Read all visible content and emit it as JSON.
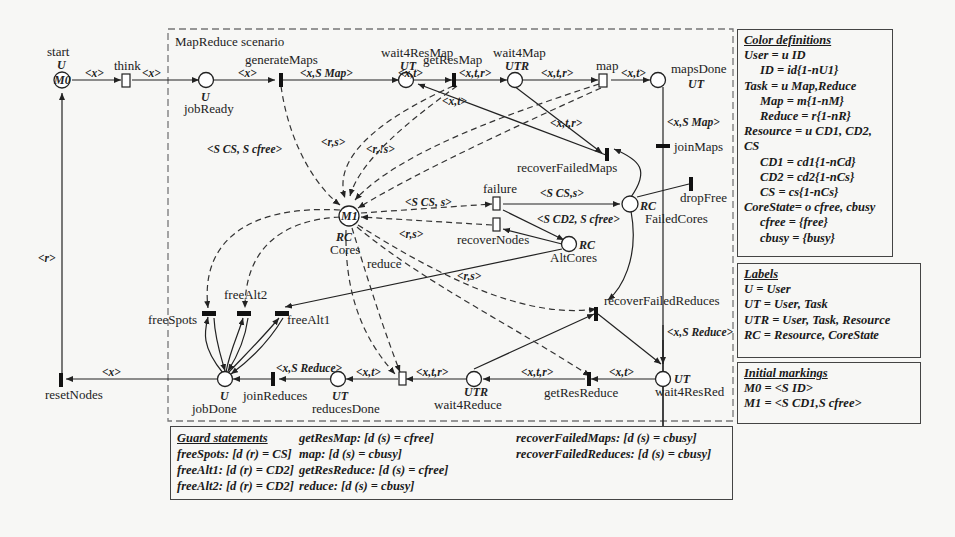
{
  "scenario": {
    "title": "MapReduce scenario"
  },
  "places": {
    "start": {
      "name": "start",
      "color": "U",
      "marking": "M0"
    },
    "jobReady": {
      "name": "jobReady",
      "color": "U"
    },
    "wait4ResMap": {
      "name": "wait4ResMap",
      "color": "UT"
    },
    "wait4Map": {
      "name": "wait4Map",
      "color": "UTR"
    },
    "mapsDone": {
      "name": "mapsDone",
      "color": "UT"
    },
    "cores": {
      "name": "Cores",
      "color": "RC",
      "marking": "M1"
    },
    "failedCores": {
      "name": "FailedCores",
      "color": "RC"
    },
    "altCores": {
      "name": "AltCores",
      "color": "RC"
    },
    "jobDone": {
      "name": "jobDone",
      "color": "U"
    },
    "reducesDone": {
      "name": "reducesDone",
      "color": "UT"
    },
    "wait4Reduce": {
      "name": "wait4Reduce",
      "color": "UTR"
    },
    "wait4ResRed": {
      "name": "wait4ResRed",
      "color": "UT"
    }
  },
  "transitions": {
    "think": "think",
    "generateMaps": "generateMaps",
    "getResMap": "getResMap",
    "map": "map",
    "joinMaps": "joinMaps",
    "recoverFailedMaps": "recoverFailedMaps",
    "dropFree": "dropFree",
    "failure": "failure",
    "recoverNodes": "recoverNodes",
    "reduce": "reduce",
    "freeSpots": "freeSpots",
    "freeAlt1": "freeAlt1",
    "freeAlt2": "freeAlt2",
    "recoverFailedReduces": "recoverFailedReduces",
    "joinReduces": "joinReduces",
    "getResReduce": "getResReduce",
    "resetNodes": "resetNodes"
  },
  "arc_labels": {
    "start_think": "<x>",
    "think_jobReady": "<x>",
    "jobReady_generateMaps": "<x>",
    "generateMaps_wait4ResMap": "<x,S Map>",
    "wait4ResMap_getResMap": "<x,t>",
    "getResMap_wait4Map": "<x,t,r>",
    "wait4Map_map": "<x,t,r>",
    "map_mapsDone": "<x,t>",
    "recover_wait4ResMap": "<x,t>",
    "wait4Map_recover": "<x,t,r>",
    "mapsDone_joinMaps": "<x,S Map>",
    "cores_generate": "<S CS, S cfree>",
    "rs1": "<r,s>",
    "rnots": "<r,!s>",
    "failure_cores": "<S CS, s>",
    "recover_cores": "<r,s>",
    "reduce_rs": "<r,s>",
    "failure_failed": "<S CS,s>",
    "failure_alt": "<S CD2, S cfree>",
    "reset_start": "<r>",
    "jobDone_reset": "<x>",
    "joinReduces_reducesDone": "<x,S Reduce>",
    "reducesDone_reduce": "<x,t>",
    "reduce_wait4Reduce": "<x,t,r>",
    "wait4Reduce_getResReduce": "<x,t,r>",
    "getResReduce_wait4ResRed": "<x,t>",
    "rfr_wait4ResRed": "<x,S Reduce>"
  },
  "color_definitions": {
    "title": "Color definitions",
    "lines": [
      {
        "text": "User = u ID",
        "indent": false
      },
      {
        "text": "ID = id{1-nU1}",
        "indent": true
      },
      {
        "text": "Task = u Map,Reduce",
        "indent": false
      },
      {
        "text": "Map = m{1-nM}",
        "indent": true
      },
      {
        "text": "Reduce = r{1-nR}",
        "indent": true
      },
      {
        "text": "Resource = u CD1, CD2, CS",
        "indent": false
      },
      {
        "text": "CD1 = cd1{1-nCd}",
        "indent": true
      },
      {
        "text": "CD2 = cd2{1-nCs}",
        "indent": true
      },
      {
        "text": "CS = cs{1-nCs}",
        "indent": true
      },
      {
        "text": "CoreState= o cfree, cbusy",
        "indent": false
      },
      {
        "text": "cfree = {free}",
        "indent": true
      },
      {
        "text": "cbusy = {busy}",
        "indent": true
      }
    ]
  },
  "labels": {
    "title": "Labels",
    "lines": [
      "U = User",
      "UT = User, Task",
      "UTR = User, Task, Resource",
      "RC = Resource, CoreState"
    ]
  },
  "initial_markings": {
    "title": "Initial markings",
    "lines": [
      "M0 = <S ID>",
      "M1 = <S CD1,S cfree>"
    ]
  },
  "guard_statements": {
    "title": "Guard statements",
    "col1": [
      "freeSpots: [d (r) = CS]",
      "freeAlt1: [d (r) = CD2]",
      "freeAlt2: [d (r) = CD2]"
    ],
    "col2": [
      "getResMap: [d (s) = cfree]",
      "map: [d (s) = cbusy]",
      "getResReduce: [d (s) = cfree]",
      "reduce: [d (s) = cbusy]"
    ],
    "col3": [
      "recoverFailedMaps: [d (s) = cbusy]",
      "recoverFailedReduces: [d (s) = cbusy]"
    ]
  }
}
